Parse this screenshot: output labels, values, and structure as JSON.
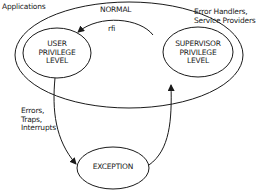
{
  "diagram": {
    "outer_region": {
      "state": "NORMAL",
      "left_label": "Applications",
      "right_label_lines": [
        "Error Handlers,",
        "Service Providers"
      ]
    },
    "nodes": {
      "user": {
        "lines": [
          "USER",
          "PRIVILEGE",
          "LEVEL"
        ]
      },
      "supervisor": {
        "lines": [
          "SUPERVISOR",
          "PRIVILEGE",
          "LEVEL"
        ]
      },
      "exception": {
        "label": "EXCEPTION"
      }
    },
    "edges": {
      "rfi": {
        "label": "rfi",
        "from": "supervisor",
        "to": "user"
      },
      "to_exception": {
        "label_lines": [
          "Errors,",
          "Traps,",
          "Interrupts"
        ],
        "from": "user",
        "to": "exception"
      },
      "to_supervisor": {
        "label": "",
        "from": "exception",
        "to": "supervisor"
      }
    },
    "colors": {
      "stroke": "#1a1a1a",
      "background": "#ffffff"
    }
  }
}
